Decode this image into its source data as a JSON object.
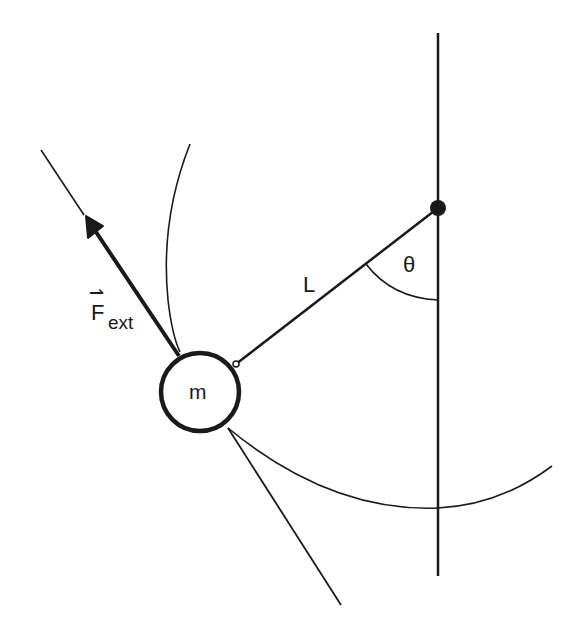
{
  "diagram": {
    "labels": {
      "length": "L",
      "angle": "θ",
      "mass": "m",
      "force_main": "F",
      "force_sub": "ext",
      "force_arrow": "⇀"
    },
    "colors": {
      "ink": "#1a1a1a",
      "background": "#ffffff"
    }
  }
}
